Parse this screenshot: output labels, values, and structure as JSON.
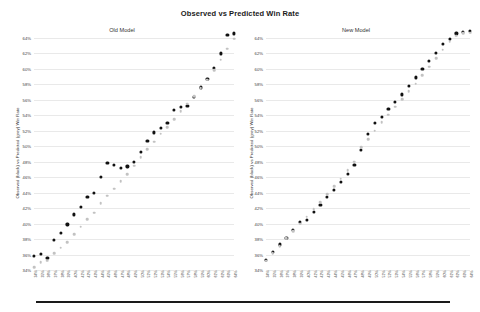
{
  "chart_data": {
    "type": "scatter",
    "title": "Observed vs Predicted Win Rate",
    "ylabel": "Observed (black) vs Predicted (grey) Win Rate",
    "xlabel": "",
    "ylim": [
      34,
      64
    ],
    "grid": true,
    "legend_position": "none",
    "ytick_labels": [
      "64%",
      "62%",
      "60%",
      "58%",
      "56%",
      "54%",
      "52%",
      "50%",
      "48%",
      "46%",
      "44%",
      "42%",
      "40%",
      "38%",
      "36%",
      "34%"
    ],
    "ytick_values": [
      64,
      62,
      60,
      58,
      56,
      54,
      52,
      50,
      48,
      46,
      44,
      42,
      40,
      38,
      36,
      34
    ],
    "xtick_labels": [
      "34%",
      "35%",
      "36%",
      "37%",
      "38%",
      "39%",
      "40%",
      "41%",
      "42%",
      "43%",
      "44%",
      "45%",
      "46%",
      "47%",
      "48%",
      "49%",
      "50%",
      "51%",
      "52%",
      "53%",
      "54%",
      "55%",
      "56%",
      "57%",
      "58%",
      "59%",
      "60%",
      "61%",
      "62%",
      "63%",
      "64%"
    ],
    "panels": [
      {
        "name": "Old Model",
        "series": [
          {
            "name": "Observed (black)",
            "color": "#111111",
            "x": [
              34,
              35,
              36,
              37,
              38,
              39,
              40,
              41,
              42,
              43,
              44,
              45,
              46,
              47,
              48,
              49,
              50,
              51,
              52,
              53,
              54,
              55,
              56,
              57,
              58,
              59,
              60,
              61,
              62,
              63,
              64
            ],
            "values": [
              35.8,
              36.1,
              35.6,
              37.9,
              38.8,
              39.9,
              41.2,
              42.2,
              43.5,
              44.0,
              46.0,
              47.8,
              47.6,
              47.2,
              47.4,
              48.0,
              49.3,
              50.7,
              51.8,
              52.4,
              53.0,
              54.7,
              55.1,
              55.2,
              56.4,
              57.6,
              58.7,
              60.1,
              62.0,
              64.4,
              64.6
            ]
          },
          {
            "name": "Predicted (grey)",
            "color": "#c2c2c2",
            "x": [
              34,
              35,
              36,
              37,
              38,
              39,
              40,
              41,
              42,
              43,
              44,
              45,
              46,
              47,
              48,
              49,
              50,
              51,
              52,
              53,
              54,
              55,
              56,
              57,
              58,
              59,
              60,
              61,
              62,
              63,
              64
            ],
            "values": [
              34.4,
              35.0,
              35.2,
              36.2,
              36.9,
              37.6,
              38.6,
              39.6,
              40.6,
              41.4,
              42.6,
              43.6,
              44.5,
              45.5,
              46.4,
              47.5,
              48.6,
              49.6,
              50.6,
              51.6,
              52.5,
              53.5,
              54.5,
              55.5,
              56.5,
              57.5,
              58.6,
              59.8,
              61.2,
              62.6,
              63.9
            ]
          }
        ]
      },
      {
        "name": "New Model",
        "series": [
          {
            "name": "Observed (black)",
            "color": "#111111",
            "x": [
              34,
              35,
              36,
              37,
              38,
              39,
              40,
              41,
              42,
              43,
              44,
              45,
              46,
              47,
              48,
              49,
              50,
              51,
              52,
              53,
              54,
              55,
              56,
              57,
              58,
              59,
              60,
              61,
              62,
              63,
              64
            ],
            "values": [
              35.3,
              36.3,
              37.3,
              38.2,
              39.2,
              40.2,
              40.5,
              41.5,
              42.4,
              43.4,
              44.4,
              45.4,
              46.4,
              47.6,
              49.5,
              51.6,
              53.0,
              53.8,
              54.8,
              55.7,
              56.7,
              57.8,
              58.9,
              60.0,
              61.0,
              62.1,
              63.2,
              63.9,
              64.6,
              64.8,
              64.9
            ]
          },
          {
            "name": "Predicted (grey)",
            "color": "#c2c2c2",
            "x": [
              34,
              35,
              36,
              37,
              38,
              39,
              40,
              41,
              42,
              43,
              44,
              45,
              46,
              47,
              48,
              49,
              50,
              51,
              52,
              53,
              54,
              55,
              56,
              57,
              58,
              59,
              60,
              61,
              62,
              63,
              64
            ],
            "values": [
              35.2,
              36.2,
              37.1,
              38.1,
              39.0,
              40.0,
              40.9,
              41.9,
              42.8,
              43.8,
              44.8,
              45.8,
              46.9,
              48.0,
              49.9,
              50.9,
              52.0,
              53.1,
              54.1,
              55.1,
              56.1,
              57.1,
              58.1,
              59.2,
              60.3,
              61.4,
              62.5,
              63.5,
              64.3,
              64.6,
              64.7
            ]
          }
        ]
      }
    ]
  },
  "footer": {
    "rule": ""
  }
}
